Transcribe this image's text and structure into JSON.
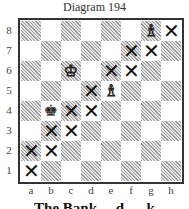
{
  "title": "Diagram 194",
  "caption": "The Bank… d … k",
  "ranks": [
    "8",
    "7",
    "6",
    "5",
    "4",
    "3",
    "2",
    "1"
  ],
  "files": [
    "a",
    "b",
    "c",
    "d",
    "e",
    "f",
    "g",
    "h"
  ],
  "pieces": [
    {
      "square": "g8",
      "piece": "bishop",
      "color": "white",
      "glyph": "♗"
    },
    {
      "square": "c6",
      "piece": "king",
      "color": "white",
      "glyph": "♔"
    },
    {
      "square": "e5",
      "piece": "bishop",
      "color": "white",
      "glyph": "♗"
    },
    {
      "square": "b4",
      "piece": "king",
      "color": "black",
      "glyph": "♚"
    }
  ],
  "marked_squares": [
    "h8",
    "f7",
    "g7",
    "e6",
    "f6",
    "d5",
    "c4",
    "d4",
    "b3",
    "c3",
    "a2",
    "b2",
    "a1"
  ],
  "mark_glyph": "✕"
}
